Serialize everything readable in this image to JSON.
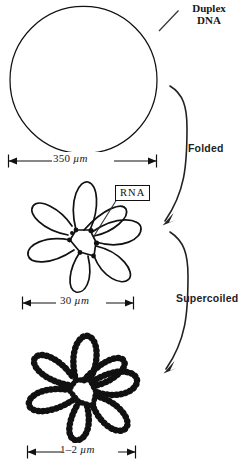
{
  "figure": {
    "type": "biology-diagram"
  },
  "callouts": {
    "duplex_line1": "Duplex",
    "duplex_line2": "DNA",
    "rna": "RNA"
  },
  "process_labels": {
    "folded": "Folded",
    "supercoiled": "Supercoiled"
  },
  "scales": [
    {
      "id": "scale-350",
      "value": "350",
      "unit": "µm"
    },
    {
      "id": "scale-30",
      "value": "30",
      "unit": "µm"
    },
    {
      "id": "scale-1-2",
      "value": "1–2",
      "unit": "µm"
    }
  ],
  "stages": [
    {
      "id": "stage-duplex-circle",
      "name": "Duplex DNA circle",
      "scale": "350 µm"
    },
    {
      "id": "stage-folded-rosette",
      "name": "Folded rosette with RNA cores",
      "scale": "30 µm",
      "loops": 7
    },
    {
      "id": "stage-supercoiled-rosette",
      "name": "Supercoiled rosette",
      "scale": "1–2 µm",
      "loops": 7
    }
  ],
  "colors": {
    "ink": "#111111",
    "background": "#ffffff"
  }
}
